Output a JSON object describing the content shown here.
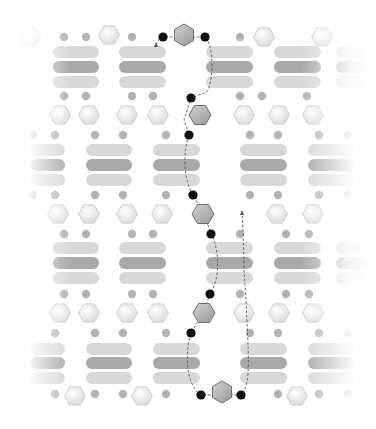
{
  "diagram": {
    "title": "",
    "colors": {
      "background": "#ffffff",
      "bar_light": "#d8d8d8",
      "bar_dark": "#a9a9a9",
      "dot_mid": "#a6a6a6",
      "dot_light": "#c8c8c8",
      "hex_fill": "#eeeeee",
      "hex_stroke": "#cfcfcf",
      "path_hex_fill": "#b8b8b8",
      "path_hex_stroke": "#6f6f6f",
      "path_node": "#111111",
      "path_line": "#555555"
    },
    "bar_rows": [
      {
        "ys": [
          52,
          67,
          82
        ],
        "columns": [
          [
            53,
            99
          ],
          [
            119,
            166
          ],
          [
            206,
            253
          ],
          [
            274,
            321
          ],
          [
            336,
            365
          ]
        ]
      },
      {
        "ys": [
          150,
          165,
          180
        ],
        "columns": [
          [
            30,
            65
          ],
          [
            86,
            132
          ],
          [
            153,
            200
          ],
          [
            240,
            287
          ],
          [
            308,
            355
          ]
        ]
      },
      {
        "ys": [
          248,
          263,
          278
        ],
        "columns": [
          [
            53,
            99
          ],
          [
            119,
            166
          ],
          [
            206,
            253
          ],
          [
            274,
            321
          ],
          [
            336,
            365
          ]
        ]
      },
      {
        "ys": [
          349,
          363,
          378
        ],
        "columns": [
          [
            30,
            65
          ],
          [
            86,
            132
          ],
          [
            153,
            200
          ],
          [
            240,
            287
          ],
          [
            308,
            355
          ]
        ]
      }
    ],
    "dots": [
      [
        64,
        37
      ],
      [
        86,
        37
      ],
      [
        132,
        37
      ],
      [
        240,
        37
      ],
      [
        262,
        37
      ],
      [
        328,
        37
      ],
      [
        64,
        96
      ],
      [
        86,
        96
      ],
      [
        132,
        96
      ],
      [
        153,
        96
      ],
      [
        240,
        96
      ],
      [
        262,
        96
      ],
      [
        307,
        96
      ],
      [
        33,
        135
      ],
      [
        55,
        135
      ],
      [
        95,
        135
      ],
      [
        123,
        135
      ],
      [
        166,
        135
      ],
      [
        250,
        135
      ],
      [
        278,
        135
      ],
      [
        319,
        135
      ],
      [
        348,
        135
      ],
      [
        33,
        195
      ],
      [
        55,
        195
      ],
      [
        95,
        195
      ],
      [
        123,
        195
      ],
      [
        166,
        195
      ],
      [
        250,
        195
      ],
      [
        278,
        195
      ],
      [
        319,
        195
      ],
      [
        348,
        195
      ],
      [
        64,
        234
      ],
      [
        86,
        234
      ],
      [
        132,
        234
      ],
      [
        153,
        234
      ],
      [
        240,
        234
      ],
      [
        286,
        234
      ],
      [
        309,
        234
      ],
      [
        64,
        294
      ],
      [
        86,
        294
      ],
      [
        132,
        294
      ],
      [
        153,
        294
      ],
      [
        240,
        294
      ],
      [
        286,
        294
      ],
      [
        309,
        294
      ],
      [
        55,
        333
      ],
      [
        95,
        333
      ],
      [
        123,
        333
      ],
      [
        166,
        333
      ],
      [
        250,
        333
      ],
      [
        278,
        333
      ],
      [
        319,
        333
      ],
      [
        348,
        333
      ],
      [
        55,
        394
      ],
      [
        95,
        394
      ],
      [
        123,
        394
      ],
      [
        166,
        394
      ],
      [
        278,
        394
      ],
      [
        319,
        394
      ],
      [
        348,
        394
      ]
    ],
    "hexes": [
      [
        30,
        37
      ],
      [
        109,
        35
      ],
      [
        264,
        37
      ],
      [
        322,
        37
      ],
      [
        60,
        115
      ],
      [
        89,
        115
      ],
      [
        127,
        115
      ],
      [
        158,
        115
      ],
      [
        244,
        115
      ],
      [
        279,
        115
      ],
      [
        313,
        115
      ],
      [
        58,
        214
      ],
      [
        89,
        214
      ],
      [
        127,
        214
      ],
      [
        162,
        214
      ],
      [
        277,
        214
      ],
      [
        313,
        214
      ],
      [
        60,
        313
      ],
      [
        89,
        313
      ],
      [
        127,
        313
      ],
      [
        158,
        313
      ],
      [
        244,
        313
      ],
      [
        279,
        313
      ],
      [
        313,
        313
      ],
      [
        75,
        396
      ],
      [
        142,
        396
      ],
      [
        297,
        396
      ]
    ],
    "path": {
      "nodes": [
        [
          163,
          37
        ],
        [
          205,
          37
        ],
        [
          191,
          98
        ],
        [
          189,
          135
        ],
        [
          193,
          195
        ],
        [
          211,
          234
        ],
        [
          210,
          294
        ],
        [
          191,
          333
        ],
        [
          201,
          395
        ],
        [
          241,
          395
        ]
      ],
      "hexes": [
        [
          184,
          35
        ],
        [
          200,
          115
        ],
        [
          203,
          214
        ],
        [
          204,
          313
        ],
        [
          222,
          392
        ]
      ],
      "dashed_d": "M156,45 C158,40 160,38 163,37 L205,37 C214,45 214,80 207,92 L191,98 L184,120 L189,135 C183,150 183,180 193,195 L204,214 L211,234 C220,250 220,280 210,294 L203,313 L191,333 C185,350 185,385 201,395 L241,395 C252,385 248,350 246,300 L244,270 C244,250 243,230 242,213",
      "arrows": [
        [
          156,
          45
        ],
        [
          242,
          213
        ]
      ]
    }
  }
}
